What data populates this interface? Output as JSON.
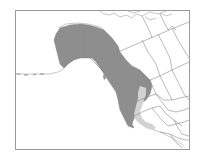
{
  "map": {
    "type": "species-range-map",
    "region": "Western North America",
    "colors": {
      "background": "#ffffff",
      "frame": "#9a9a9a",
      "boundary": "#8a8a8a",
      "coastline": "#a0a0a0",
      "primary_range": "#8e8e8e",
      "secondary_range": "#d2d2d2",
      "range_edge": "#6e6e6e"
    },
    "legend": [],
    "labels": []
  }
}
